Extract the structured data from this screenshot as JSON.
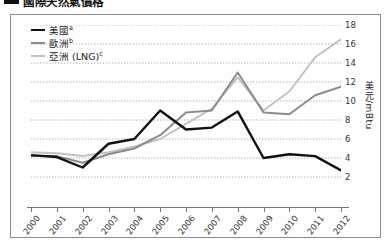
{
  "title": {
    "text": "國際天然氣價格",
    "swatch_color": "#111111"
  },
  "legend": {
    "position": "top-left",
    "items": [
      {
        "label": "美國",
        "note": "a",
        "color": "#111111",
        "width": 2.6
      },
      {
        "label": "歐洲",
        "note": "b",
        "color": "#8c8c8c",
        "width": 2.2
      },
      {
        "label": "亞洲 (LNG)",
        "note": "c",
        "color": "#c2c2c2",
        "width": 2.2
      }
    ]
  },
  "axes": {
    "y_title": "美元/mBtu",
    "y_ticks": [
      2,
      4,
      6,
      8,
      10,
      12,
      14,
      16,
      18
    ],
    "x_ticks": [
      "2000",
      "2001",
      "2002",
      "2003",
      "2004",
      "2005",
      "2006",
      "2007",
      "2008",
      "2009",
      "2010",
      "2011",
      "2012"
    ]
  },
  "chart_data": {
    "type": "line",
    "title": "國際天然氣價格",
    "xlabel": "",
    "ylabel": "美元/mBtu",
    "categories": [
      "2000",
      "2001",
      "2002",
      "2003",
      "2004",
      "2005",
      "2006",
      "2007",
      "2008",
      "2009",
      "2010",
      "2011",
      "2012"
    ],
    "x": [
      2000,
      2001,
      2002,
      2003,
      2004,
      2005,
      2006,
      2007,
      2008,
      2009,
      2010,
      2011,
      2012
    ],
    "ylim": [
      0,
      18
    ],
    "xlim": [
      2000,
      2012
    ],
    "grid": true,
    "grid_style": "dotted-horizontal",
    "legend_position": "top-left",
    "series": [
      {
        "name": "美國",
        "note": "a",
        "color": "#111111",
        "values": [
          4.3,
          4.1,
          3.0,
          5.5,
          6.0,
          9.0,
          7.0,
          7.2,
          8.9,
          4.0,
          4.4,
          4.2,
          2.7
        ]
      },
      {
        "name": "歐洲",
        "note": "b",
        "color": "#8c8c8c",
        "values": [
          4.2,
          4.2,
          3.5,
          4.4,
          5.0,
          6.4,
          8.8,
          9.0,
          13.0,
          8.8,
          8.6,
          10.6,
          11.5
        ]
      },
      {
        "name": "亞洲 (LNG)",
        "note": "c",
        "color": "#c2c2c2",
        "values": [
          4.6,
          4.5,
          4.2,
          4.6,
          5.2,
          6.0,
          7.6,
          9.2,
          12.5,
          9.0,
          11.0,
          14.6,
          16.5
        ]
      }
    ]
  }
}
